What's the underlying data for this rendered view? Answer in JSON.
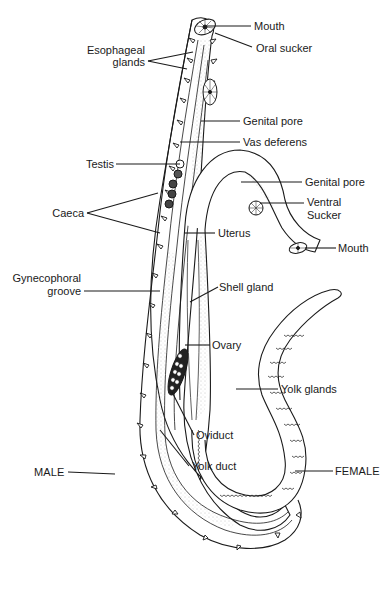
{
  "diagram": {
    "labels": {
      "mouth_male": "Mouth",
      "oral_sucker": "Oral sucker",
      "esophageal_glands_1": "Esophageal",
      "esophageal_glands_2": "glands",
      "genital_pore_male": "Genital pore",
      "vas_deferens": "Vas deferens",
      "testis": "Testis",
      "genital_pore_female": "Genital pore",
      "ventral_sucker_1": "Ventral",
      "ventral_sucker_2": "Sucker",
      "caeca": "Caeca",
      "uterus": "Uterus",
      "mouth_female": "Mouth",
      "gynecophoral_groove_1": "Gynecophoral",
      "gynecophoral_groove_2": "groove",
      "shell_gland": "Shell gland",
      "ovary": "Ovary",
      "yolk_glands": "Yolk glands",
      "oviduct": "Oviduct",
      "yolk_duct": "Yolk duct",
      "male": "MALE",
      "female": "FEMALE"
    },
    "colors": {
      "ink": "#1a1a1a",
      "stipple": "#9a9a9a",
      "background": "#ffffff"
    }
  }
}
